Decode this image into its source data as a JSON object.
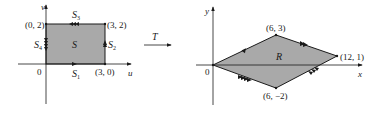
{
  "figure": {
    "transform_label": "T",
    "left_panel": {
      "axes": {
        "horizontal": "u",
        "vertical": "v",
        "origin": "0"
      },
      "region_label": "S",
      "vertices": [
        {
          "label": "(0, 2)",
          "u": 0,
          "v": 2
        },
        {
          "label": "(3, 2)",
          "u": 3,
          "v": 2
        },
        {
          "label": "(3, 0)",
          "u": 3,
          "v": 0
        }
      ],
      "sides": [
        {
          "name": "S",
          "sub": "1",
          "position": "bottom",
          "arrows": 1
        },
        {
          "name": "S",
          "sub": "2",
          "position": "right",
          "arrows": 2
        },
        {
          "name": "S",
          "sub": "3",
          "position": "top",
          "arrows": 3
        },
        {
          "name": "S",
          "sub": "4",
          "position": "left",
          "arrows": 4
        }
      ]
    },
    "right_panel": {
      "axes": {
        "horizontal": "x",
        "vertical": "y",
        "origin": "0"
      },
      "region_label": "R",
      "vertices": [
        {
          "label": "(6, 3)",
          "x": 6,
          "y": 3
        },
        {
          "label": "(12, 1)",
          "x": 12,
          "y": 1
        },
        {
          "label": "(6, −2)",
          "x": 6,
          "y": -2
        }
      ]
    },
    "colors": {
      "fill": "#a9a9a9",
      "stroke": "#1a1a1a",
      "background": "#ffffff"
    }
  }
}
